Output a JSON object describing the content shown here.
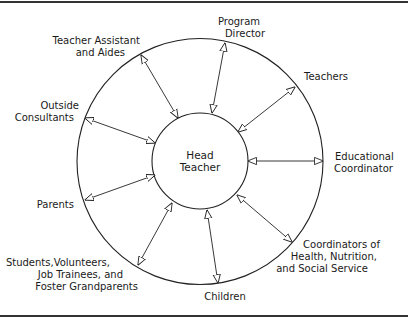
{
  "diagram": {
    "center": {
      "lines": [
        "Head",
        "Teacher"
      ]
    },
    "nodes": [
      {
        "id": "program-director",
        "lines": [
          "Program",
          "Director"
        ]
      },
      {
        "id": "teachers",
        "lines": [
          "Teachers"
        ]
      },
      {
        "id": "educational-coordinator",
        "lines": [
          "Educational",
          "Coordinator"
        ]
      },
      {
        "id": "coordinators-health",
        "lines": [
          "Coordinators of",
          "Health, Nutrition,",
          "and Social Service"
        ]
      },
      {
        "id": "children",
        "lines": [
          "Children"
        ]
      },
      {
        "id": "students-volunteers",
        "lines": [
          "Students,Volunteers,",
          "Job Trainees, and",
          "Foster Grandparents"
        ]
      },
      {
        "id": "parents",
        "lines": [
          "Parents"
        ]
      },
      {
        "id": "outside-consultants",
        "lines": [
          "Outside",
          "Consultants"
        ]
      },
      {
        "id": "teacher-assistant",
        "lines": [
          "Teacher Assistant",
          "and Aides"
        ]
      }
    ],
    "connections": "bidirectional arrows between Head Teacher and each surrounding role",
    "colors": {
      "stroke": "#222222",
      "text": "#1a1a1a",
      "background": "#ffffff"
    }
  }
}
